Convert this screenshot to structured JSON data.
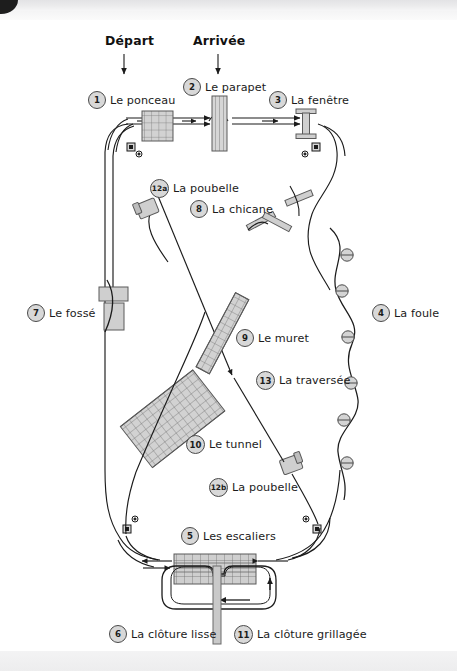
{
  "page": {
    "kind": "course-diagram",
    "language": "fr",
    "background": "#ffffff",
    "ink": "#1b1b1b",
    "obstacle_fill": "#d2d2d2",
    "obstacle_stroke": "#555555",
    "marker_fill": "#d8d8d8",
    "marker_stroke": "#4a4a4a"
  },
  "start_marker": {
    "label": "Départ",
    "x": 124,
    "y": 45
  },
  "finish_marker": {
    "label": "Arrivée",
    "x": 218,
    "y": 45
  },
  "stations": [
    {
      "id": "1",
      "number": "1",
      "label": "Le ponceau",
      "cx": 97,
      "cy": 100,
      "tx": 110,
      "ty": 95
    },
    {
      "id": "2",
      "number": "2",
      "label": "Le parapet",
      "cx": 192,
      "cy": 87,
      "tx": 205,
      "ty": 82
    },
    {
      "id": "3",
      "number": "3",
      "label": "La fenêtre",
      "cx": 278,
      "cy": 100,
      "tx": 291,
      "ty": 95
    },
    {
      "id": "12a",
      "number": "12a",
      "label": "La poubelle",
      "cx": 160,
      "cy": 188,
      "tx": 175,
      "ty": 183
    },
    {
      "id": "8",
      "number": "8",
      "label": "La chicane",
      "cx": 199,
      "cy": 209,
      "tx": 212,
      "ty": 204
    },
    {
      "id": "7",
      "number": "7",
      "label": "Le fossé",
      "cx": 36,
      "cy": 313,
      "tx": 49,
      "ty": 308
    },
    {
      "id": "4",
      "number": "4",
      "label": "La foule",
      "cx": 381,
      "cy": 313,
      "tx": 394,
      "ty": 308
    },
    {
      "id": "9",
      "number": "9",
      "label": "Le muret",
      "cx": 245,
      "cy": 338,
      "tx": 258,
      "ty": 333
    },
    {
      "id": "13",
      "number": "13",
      "label": "La traversée",
      "cx": 265,
      "cy": 380,
      "tx": 280,
      "ty": 375
    },
    {
      "id": "10",
      "number": "10",
      "label": "Le tunnel",
      "cx": 196,
      "cy": 444,
      "tx": 210,
      "ty": 439
    },
    {
      "id": "12b",
      "number": "12b",
      "label": "La poubelle",
      "cx": 219,
      "cy": 487,
      "tx": 234,
      "ty": 482
    },
    {
      "id": "5",
      "number": "5",
      "label": "Les escaliers",
      "cx": 190,
      "cy": 536,
      "tx": 203,
      "ty": 531
    },
    {
      "id": "6",
      "number": "6",
      "label": "La clôture lisse",
      "cx": 118,
      "cy": 634,
      "tx": 131,
      "ty": 629
    },
    {
      "id": "11",
      "number": "11",
      "label": "La clôture grillagée",
      "cx": 243,
      "cy": 634,
      "tx": 257,
      "ty": 629
    }
  ],
  "crowd_markers": [
    {
      "cx": 347,
      "cy": 255
    },
    {
      "cx": 342,
      "cy": 291
    },
    {
      "cx": 348,
      "cy": 337
    },
    {
      "cx": 351,
      "cy": 383
    },
    {
      "cx": 344,
      "cy": 420
    },
    {
      "cx": 347,
      "cy": 463
    }
  ],
  "corner_targets": [
    {
      "cx": 132,
      "cy": 148
    },
    {
      "cx": 316,
      "cy": 148
    },
    {
      "cx": 128,
      "cy": 529
    },
    {
      "cx": 317,
      "cy": 529
    }
  ]
}
